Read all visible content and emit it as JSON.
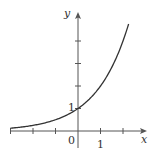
{
  "chart_data": {
    "type": "line",
    "title": "",
    "function": "y = 2^x",
    "xlabel": "x",
    "ylabel": "y",
    "xlim": [
      -3,
      2.3
    ],
    "ylim": [
      -0.7,
      5.2
    ],
    "x_ticks": [
      -3,
      -2,
      -1,
      0,
      1,
      2
    ],
    "y_ticks": [
      1,
      2,
      3,
      4
    ],
    "tick_labels": {
      "x_one": "1",
      "y_one": "1",
      "origin": "0"
    },
    "grid": false,
    "legend": null,
    "series": [
      {
        "name": "2^x",
        "x": [
          -3,
          -2,
          -1,
          0,
          1,
          2,
          2.27
        ],
        "values": [
          0.125,
          0.25,
          0.5,
          1,
          2,
          4,
          4.82
        ]
      }
    ],
    "colors": {
      "curve": "#333333",
      "axis": "#555555"
    }
  },
  "labels": {
    "x_axis": "x",
    "y_axis": "y",
    "origin": "0",
    "x_one": "1",
    "y_one": "1"
  }
}
